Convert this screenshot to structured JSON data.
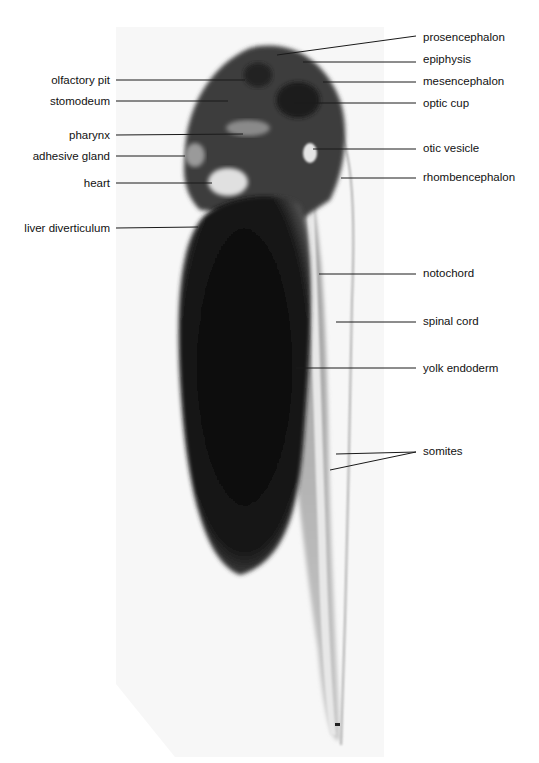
{
  "figure": {
    "left_labels": [
      {
        "text": "olfactory pit",
        "y": 80
      },
      {
        "text": "stomodeum",
        "y": 101
      },
      {
        "text": "pharynx",
        "y": 135
      },
      {
        "text": "adhesive gland",
        "y": 156
      },
      {
        "text": "heart",
        "y": 183
      },
      {
        "text": "liver diverticulum",
        "y": 228
      }
    ],
    "right_labels": [
      {
        "text": "prosencephalon",
        "y": 37
      },
      {
        "text": "epiphysis",
        "y": 59
      },
      {
        "text": "mesencephalon",
        "y": 81
      },
      {
        "text": "optic cup",
        "y": 103
      },
      {
        "text": "otic vesicle",
        "y": 148
      },
      {
        "text": "rhombencephalon",
        "y": 177
      },
      {
        "text": "notochord",
        "y": 273
      },
      {
        "text": "spinal cord",
        "y": 321
      },
      {
        "text": "yolk endoderm",
        "y": 368
      },
      {
        "text": "somites",
        "y": 451
      }
    ],
    "colors": {
      "background": "#ffffff",
      "photo_bg": "#f7f7f7",
      "yolk": "#0d0d0d",
      "tissue": "#4a4a4a",
      "line": "#1a1a1a"
    }
  }
}
